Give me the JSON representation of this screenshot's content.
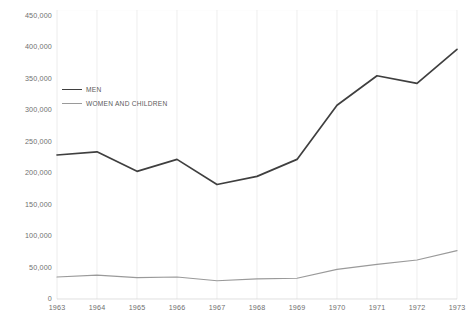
{
  "chart_data": {
    "type": "line",
    "title": "",
    "xlabel": "",
    "ylabel": "",
    "categories": [
      "1963",
      "1964",
      "1965",
      "1966",
      "1967",
      "1968",
      "1969",
      "1970",
      "1971",
      "1972",
      "1973"
    ],
    "x": [
      1963,
      1964,
      1965,
      1966,
      1967,
      1968,
      1969,
      1970,
      1971,
      1972,
      1973
    ],
    "series": [
      {
        "name": "MEN",
        "color": "#3f3f3f",
        "values": [
          229000,
          234000,
          203000,
          222000,
          182000,
          195000,
          222000,
          308000,
          355000,
          343000,
          397000
        ]
      },
      {
        "name": "WOMEN AND CHILDREN",
        "color": "#9a9a9a",
        "values": [
          35000,
          38000,
          34000,
          35000,
          29000,
          32000,
          33000,
          47000,
          55000,
          62000,
          77000
        ]
      }
    ],
    "ylim": [
      0,
      450000
    ],
    "ytick_values": [
      0,
      50000,
      100000,
      150000,
      200000,
      250000,
      300000,
      350000,
      400000,
      450000
    ],
    "ytick_labels": [
      "0",
      "50,000",
      "100,000",
      "150,000",
      "200,000",
      "250,000",
      "300,000",
      "350,000",
      "400,000",
      "450,000"
    ],
    "grid": {
      "vertical": true,
      "horizontal": false
    },
    "legend": {
      "position": "upper-left-inside",
      "entries": [
        {
          "label": "MEN",
          "color": "#3f3f3f"
        },
        {
          "label": "WOMEN AND CHILDREN",
          "color": "#9a9a9a"
        }
      ]
    }
  }
}
